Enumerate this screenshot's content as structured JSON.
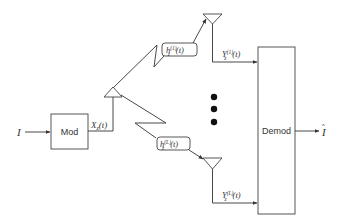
{
  "diagram": {
    "input_symbol": "I",
    "output_symbol": "I",
    "output_hat": "^",
    "mod_label": "Mod",
    "demod_label": "Demod",
    "tx_signal": {
      "base": "X",
      "sub": "z",
      "arg": "(t)"
    },
    "channels": [
      {
        "base": "h",
        "sub": "z",
        "sup": "(1)",
        "arg": "(t)"
      },
      {
        "base": "h",
        "sub": "z",
        "sup": "(L)",
        "arg": "(t)"
      }
    ],
    "rx_signals": [
      {
        "base": "Y",
        "sub": "z",
        "sup": "(1)",
        "arg": "(t)"
      },
      {
        "base": "Y",
        "sub": "z",
        "sup": "(L)",
        "arg": "(t)"
      }
    ],
    "ellipsis": "three vertical dots",
    "line_color": "#333333"
  }
}
